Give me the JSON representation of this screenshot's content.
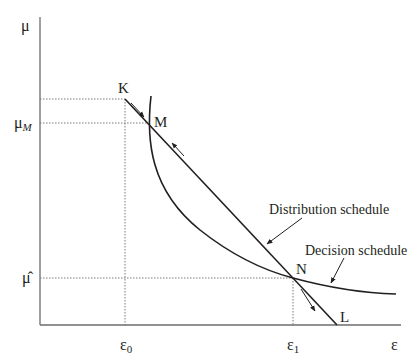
{
  "diagram": {
    "axes": {
      "y_label": "μ",
      "x_label": "ε"
    },
    "y_ticks": [
      {
        "id": "mu_M",
        "label": "μ",
        "subscript": "M",
        "level": "M"
      },
      {
        "id": "mu_hat",
        "label": "μ̂",
        "level": "N"
      }
    ],
    "x_ticks": [
      {
        "id": "eps_0",
        "label": "ε",
        "subscript": "0"
      },
      {
        "id": "eps_1",
        "label": "ε",
        "subscript": "1"
      }
    ],
    "points": {
      "K": "K",
      "M": "M",
      "N": "N",
      "L": "L"
    },
    "curves": {
      "distribution": "Distribution schedule",
      "decision": "Decision schedule"
    },
    "colors": {
      "line": "#231f20",
      "guide": "#7a7a7a"
    }
  }
}
